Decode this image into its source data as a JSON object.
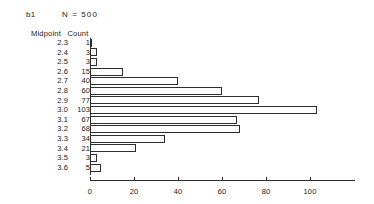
{
  "header": {
    "group_label": "b1",
    "n_label": "N = 500"
  },
  "table": {
    "midpoint_header": "Midpoint",
    "count_header": "Count"
  },
  "axis": {
    "tick_labels": [
      "0",
      "20",
      "40",
      "60",
      "80",
      "100"
    ]
  },
  "chart_data": {
    "type": "bar",
    "orientation": "horizontal",
    "title": "b1",
    "subtitle": "N = 500",
    "xlabel": "",
    "ylabel": "Midpoint",
    "categories": [
      "2.3",
      "2.4",
      "2.5",
      "2.6",
      "2.7",
      "2.8",
      "2.9",
      "3.0",
      "3.1",
      "3.2",
      "3.3",
      "3.4",
      "3.5",
      "3.6"
    ],
    "values": [
      1,
      3,
      3,
      15,
      40,
      60,
      77,
      103,
      67,
      68,
      34,
      21,
      3,
      5
    ],
    "value_labels": [
      "1",
      "3",
      "3",
      "15",
      "40",
      "60",
      "77",
      "103",
      "67",
      "68",
      "34",
      "21",
      "3",
      "5"
    ],
    "xlim": [
      0,
      120
    ],
    "xticks": [
      0,
      20,
      40,
      60,
      80,
      100
    ],
    "grid": false,
    "legend": false,
    "n_total": 500,
    "rows": [
      {
        "midpoint": "2.3",
        "count": "1",
        "value": 1
      },
      {
        "midpoint": "2.4",
        "count": "3",
        "value": 3
      },
      {
        "midpoint": "2.5",
        "count": "3",
        "value": 3
      },
      {
        "midpoint": "2.6",
        "count": "15",
        "value": 15
      },
      {
        "midpoint": "2.7",
        "count": "40",
        "value": 40
      },
      {
        "midpoint": "2.8",
        "count": "60",
        "value": 60
      },
      {
        "midpoint": "2.9",
        "count": "77",
        "value": 77
      },
      {
        "midpoint": "3.0",
        "count": "103",
        "value": 103
      },
      {
        "midpoint": "3.1",
        "count": "67",
        "value": 67
      },
      {
        "midpoint": "3.2",
        "count": "68",
        "value": 68
      },
      {
        "midpoint": "3.3",
        "count": "34",
        "value": 34
      },
      {
        "midpoint": "3.4",
        "count": "21",
        "value": 21
      },
      {
        "midpoint": "3.5",
        "count": "3",
        "value": 3
      },
      {
        "midpoint": "3.6",
        "count": "5",
        "value": 5
      }
    ]
  }
}
